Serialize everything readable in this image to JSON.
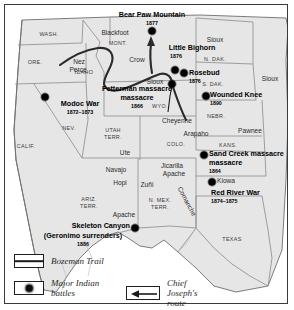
{
  "map": {
    "title": "Indian Wars of the American West",
    "colors": {
      "land": "#e6e6e6",
      "border": "#8a8a8a",
      "outline": "#6e6e6e",
      "route": "#2b2b2b",
      "battle_dot": "#0d0d0d",
      "frame": "#3a3a3a",
      "water": "#ffffff"
    }
  },
  "battles": [
    {
      "name": "Bear Paw Mountain",
      "year": "1877",
      "x": 152,
      "y": 31,
      "label_x": 152,
      "label_y": 13,
      "year_x": 152,
      "year_y": 22,
      "align": "center"
    },
    {
      "name": "Little Bighorn",
      "year": "1876",
      "x": 175,
      "y": 70,
      "label_x": 186,
      "label_y": 46,
      "year_x": 178,
      "year_y": 55,
      "align": "center"
    },
    {
      "name": "Rosebud",
      "year": "1876",
      "x": 184,
      "y": 73,
      "label_x": 192,
      "label_y": 73,
      "year_x": 192,
      "year_y": 82,
      "align": "left"
    },
    {
      "name": "Fetterman massacre",
      "year": "1866",
      "x": 172,
      "y": 84,
      "label_x": 110,
      "label_y": 88,
      "year_x": 133,
      "year_y": 104,
      "align": "left"
    },
    {
      "name": "Wounded Knee",
      "year": "1890",
      "x": 206,
      "y": 96,
      "label_x": 213,
      "label_y": 93,
      "year_x": 213,
      "year_y": 103,
      "align": "left"
    },
    {
      "name": "Modoc War",
      "year": "1872–1873",
      "x": 45,
      "y": 97,
      "label_x": 53,
      "label_y": 102,
      "year_x": 53,
      "year_y": 112,
      "align": "left"
    },
    {
      "name": "Sand Creek massacre",
      "year": "1864",
      "x": 204,
      "y": 155,
      "label_x": 211,
      "label_y": 152,
      "year_x": 211,
      "year_y": 170,
      "align": "left"
    },
    {
      "name": "Red River War",
      "year": "1874–1875",
      "x": 212,
      "y": 182,
      "label_x": 213,
      "label_y": 191,
      "year_x": 213,
      "year_y": 201,
      "align": "left"
    },
    {
      "name": "Skeleton Canyon",
      "year": "1886",
      "x": 135,
      "y": 228,
      "label_x": 131,
      "label_y": 224,
      "year_x": 98,
      "year_y": 244,
      "align": "right"
    }
  ],
  "battle_notes": {
    "fetterman_line2": "massacre",
    "sand_creek_line2": "massacre",
    "skeleton_line2": "(Geronimo surrenders)"
  },
  "states": [
    {
      "label": "WASH.",
      "x": 49,
      "y": 32
    },
    {
      "label": "ORE.",
      "x": 35,
      "y": 60
    },
    {
      "label": "IDAHO",
      "x": 84,
      "y": 70
    },
    {
      "label": "MONT.",
      "x": 118,
      "y": 41
    },
    {
      "label": "N. DAK.",
      "x": 215,
      "y": 57
    },
    {
      "label": "S. DAK.",
      "x": 213,
      "y": 82
    },
    {
      "label": "WYO.",
      "x": 160,
      "y": 104
    },
    {
      "label": "NEBR.",
      "x": 216,
      "y": 114
    },
    {
      "label": "NEV.",
      "x": 69,
      "y": 126
    },
    {
      "label": "CALIF.",
      "x": 22,
      "y": 144
    },
    {
      "label": "UTAH",
      "x": 113,
      "y": 130
    },
    {
      "label": "TERR.",
      "x": 113,
      "y": 137
    },
    {
      "label": "COLO.",
      "x": 176,
      "y": 142
    },
    {
      "label": "KANS.",
      "x": 228,
      "y": 143
    },
    {
      "label": "ARIZ.",
      "x": 89,
      "y": 199
    },
    {
      "label": "TERR.",
      "x": 89,
      "y": 206
    },
    {
      "label": "N. MEX.",
      "x": 155,
      "y": 200
    },
    {
      "label": "TERR.",
      "x": 155,
      "y": 207
    },
    {
      "label": "TEXAS",
      "x": 232,
      "y": 237
    }
  ],
  "tribes": [
    {
      "label": "Blackfoot",
      "x": 115,
      "y": 33
    },
    {
      "label": "Nez",
      "x": 79,
      "y": 62
    },
    {
      "label": "Perce",
      "x": 78,
      "y": 70
    },
    {
      "label": "Crow",
      "x": 137,
      "y": 60
    },
    {
      "label": "Sioux",
      "x": 215,
      "y": 40
    },
    {
      "label": "Sioux",
      "x": 264,
      "y": 78
    },
    {
      "label": "Sioux",
      "x": 155,
      "y": 82
    },
    {
      "label": "Cheyenne",
      "x": 177,
      "y": 121
    },
    {
      "label": "Arapaho",
      "x": 196,
      "y": 133
    },
    {
      "label": "Pawnee",
      "x": 246,
      "y": 129
    },
    {
      "label": "Ute",
      "x": 125,
      "y": 152
    },
    {
      "label": "Navajo",
      "x": 116,
      "y": 170
    },
    {
      "label": "Hopi",
      "x": 120,
      "y": 183
    },
    {
      "label": "Zuñi",
      "x": 147,
      "y": 185
    },
    {
      "label": "Jicarilla",
      "x": 170,
      "y": 166
    },
    {
      "label": "Apache",
      "x": 172,
      "y": 174
    },
    {
      "label": "Apache",
      "x": 124,
      "y": 215
    },
    {
      "label": "Kiowa",
      "x": 222,
      "y": 180
    },
    {
      "label": "Comanche",
      "x": 190,
      "y": 200
    }
  ],
  "legend": {
    "trail_label": "Bozeman Trail",
    "battles_label_line1": "Major Indian",
    "battles_label_line2": "battles",
    "route_label_line1": "Chief Joseph's",
    "route_label_line2": "route"
  }
}
